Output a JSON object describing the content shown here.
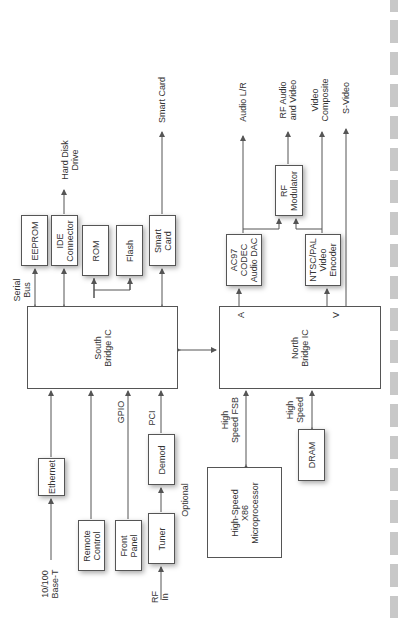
{
  "diagram": {
    "orientation": "rotated 90 degrees counter-clockwise",
    "blocks": {
      "south_bridge": "South\nBridge IC",
      "north_bridge": "North\nBridge IC",
      "eeprom": "EEPROM",
      "ide": "IDE\nConnector",
      "rom": "ROM",
      "flash": "Flash",
      "smart_card_box": "Smart\nCard",
      "ac97": "AC97\nCODEC\nAudio DAC",
      "ntsc": "NTSC/PAL\nVideo\nEncoder",
      "rf_mod": "RF\nModulator",
      "ethernet": "Ethernet",
      "remote": "Remote\nControl",
      "front_panel": "Front\nPanel",
      "tuner": "Tuner",
      "demod": "Demod",
      "cpu": "High-Speed\nX86\nMicroprocessor",
      "dram": "DRAM"
    },
    "labels": {
      "hard_disk": "Hard Disk\nDrive",
      "smart_card_out": "Smart Card",
      "serial_bus": "Serial\nBus",
      "audio_lr": "Audio L/R",
      "rf_av": "RF Audio\nand Video",
      "video_composite": "Video\nComposite",
      "s_video": "S-Video",
      "port_a": "A",
      "port_v": "V",
      "base_t": "10/100\nBase-T",
      "gpio": "GPIO",
      "pci": "PCI",
      "optional": "Optional",
      "rf_in": "RF\nIn",
      "fsb": "High\nSpeed FSB",
      "high_speed": "High\nSpeed"
    },
    "colors": {
      "line": "#555555",
      "text": "#333333",
      "dash": "#c8c8c8"
    }
  }
}
